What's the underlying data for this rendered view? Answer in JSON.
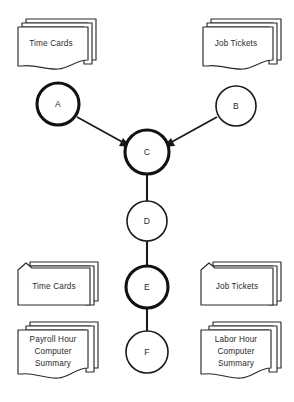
{
  "diagram": {
    "background_color": "#ffffff",
    "line_color": "#1a1a1a",
    "documents": {
      "time_cards_top": "Time Cards",
      "job_tickets_top": "Job Tickets",
      "time_cards_bottom": "Time Cards",
      "job_tickets_bottom": "Job Tickets",
      "payroll_summary_line1": "Payroll Hour",
      "payroll_summary_line2": "Computer",
      "payroll_summary_line3": "Summary",
      "labor_summary_line1": "Labor Hour",
      "labor_summary_line2": "Computer",
      "labor_summary_line3": "Summary"
    },
    "nodes": {
      "a": "A",
      "b": "B",
      "c": "C",
      "d": "D",
      "e": "E",
      "f": "F"
    }
  }
}
